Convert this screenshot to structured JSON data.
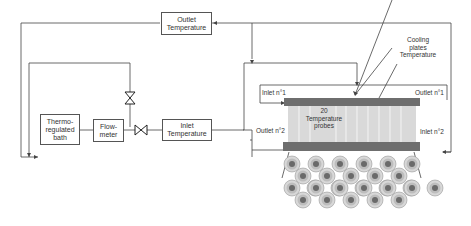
{
  "diagram": {
    "boxes": {
      "outlet_temperature": "Outlet Temperature",
      "thermo_bath": "Thermo-regulated bath",
      "flowmeter": "Flow-meter",
      "inlet_temperature": "Inlet Temperature"
    },
    "labels": {
      "cooling_plates": "Cooling plates Temperature",
      "inlet_1": "Inlet n°1",
      "outlet_1": "Outlet n°1",
      "outlet_2": "Outlet n°2",
      "inlet_2": "Inlet n°2",
      "probes": "20 Temperature probes"
    },
    "icons": [
      "valve-icon",
      "valve-icon"
    ],
    "colors": {
      "line": "#444444",
      "plate": "#6e6e6e",
      "probes_fill": "#d9d9d9",
      "cell_outer": "#cfcfcf",
      "cell_inner": "#6a6a6a"
    }
  }
}
